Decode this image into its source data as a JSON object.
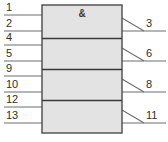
{
  "diagram": {
    "type": "iec-logic-symbol",
    "qualifier_symbol": "&",
    "colors": {
      "body_fill": "#e3e3e3",
      "body_stroke": "#4a4a4a",
      "divider": "#3a3a3a",
      "pin_line": "#6e6e6e",
      "label_text": "#2e2e2e",
      "background": "#ffffff"
    },
    "body": {
      "x": 42,
      "y": 5,
      "width": 80,
      "height": 128
    },
    "dividers": [
      38.5,
      69.5,
      100.5
    ],
    "sections": [
      {
        "index": 0,
        "top": 5,
        "bottom": 38.5,
        "inputs": [
          {
            "label": "1",
            "y": 15,
            "label_x": 6,
            "label_y": 11
          },
          {
            "label": "2",
            "y": 31,
            "label_x": 6,
            "label_y": 27
          }
        ],
        "output": {
          "label": "3",
          "y": 31,
          "slash_from_y": 18,
          "label_x": 146,
          "label_y": 27
        }
      },
      {
        "index": 1,
        "top": 38.5,
        "bottom": 69.5,
        "inputs": [
          {
            "label": "4",
            "y": 45,
            "label_x": 6,
            "label_y": 41
          },
          {
            "label": "5",
            "y": 61,
            "label_x": 6,
            "label_y": 57
          }
        ],
        "output": {
          "label": "6",
          "y": 61,
          "slash_from_y": 48,
          "label_x": 146,
          "label_y": 57
        }
      },
      {
        "index": 2,
        "top": 69.5,
        "bottom": 100.5,
        "inputs": [
          {
            "label": "9",
            "y": 76,
            "label_x": 6,
            "label_y": 72
          },
          {
            "label": "10",
            "y": 92,
            "label_x": 6,
            "label_y": 88
          }
        ],
        "output": {
          "label": "8",
          "y": 92,
          "slash_from_y": 79,
          "label_x": 146,
          "label_y": 88
        }
      },
      {
        "index": 3,
        "top": 100.5,
        "bottom": 133,
        "inputs": [
          {
            "label": "12",
            "y": 107,
            "label_x": 6,
            "label_y": 103
          },
          {
            "label": "13",
            "y": 123,
            "label_x": 6,
            "label_y": 119
          }
        ],
        "output": {
          "label": "11",
          "y": 123,
          "slash_from_y": 110,
          "label_x": 146,
          "label_y": 119
        }
      }
    ],
    "geometry": {
      "input_line_x_start": 4,
      "input_line_x_end": 42,
      "output_line_x_start": 122,
      "output_line_x_end": 166,
      "slash_x_start": 122,
      "slash_x_end": 144
    }
  }
}
